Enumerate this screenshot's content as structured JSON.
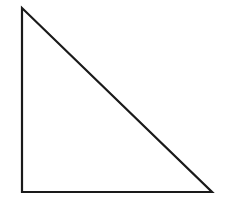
{
  "diagram": {
    "shape": "right-triangle",
    "width": 230,
    "height": 200,
    "background": "#ffffff",
    "stroke_color": "#1a1a1a",
    "stroke_width": 2.2,
    "fill": "none",
    "vertices": [
      {
        "name": "top",
        "x": 22,
        "y": 8
      },
      {
        "name": "bottom-left",
        "x": 22,
        "y": 192
      },
      {
        "name": "bottom-right",
        "x": 212,
        "y": 192
      }
    ]
  }
}
